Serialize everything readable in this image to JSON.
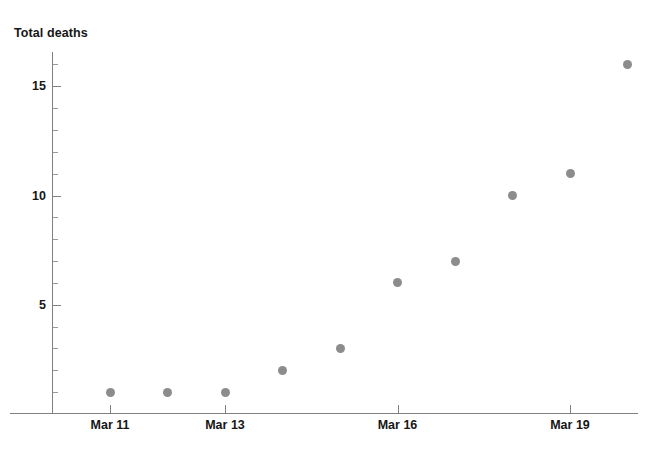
{
  "chart_data": {
    "type": "scatter",
    "title": "",
    "subtitle": "",
    "xlabel": "",
    "ylabel": "Total deaths",
    "grid": false,
    "legend": null,
    "marker_color": "#8c8c8c",
    "axis_color": "#808080",
    "text_color": "#161616",
    "x": [
      "Mar 11",
      "Mar 12",
      "Mar 13",
      "Mar 14",
      "Mar 15",
      "Mar 16",
      "Mar 17",
      "Mar 18",
      "Mar 19",
      "Mar 20"
    ],
    "values": [
      1,
      1,
      1,
      2,
      3,
      6,
      7,
      10,
      11,
      16
    ],
    "points": [
      {
        "x": "Mar 11",
        "y": 1
      },
      {
        "x": "Mar 12",
        "y": 1
      },
      {
        "x": "Mar 13",
        "y": 1
      },
      {
        "x": "Mar 14",
        "y": 2
      },
      {
        "x": "Mar 15",
        "y": 3
      },
      {
        "x": "Mar 16",
        "y": 6
      },
      {
        "x": "Mar 17",
        "y": 7
      },
      {
        "x": "Mar 18",
        "y": 10
      },
      {
        "x": "Mar 19",
        "y": 11
      },
      {
        "x": "Mar 20",
        "y": 16
      }
    ],
    "xlim": [
      "Mar 10",
      "Mar 21"
    ],
    "ylim": [
      0,
      16.7
    ],
    "x_tick_labels": [
      "Mar 11",
      "Mar 13",
      "Mar 16",
      "Mar 19"
    ],
    "y_tick_labels": [
      "5",
      "10",
      "15"
    ],
    "y_minor_tick_values": [
      1,
      2,
      3,
      4,
      6,
      7,
      8,
      9,
      11,
      12,
      13,
      14,
      16
    ],
    "y_major_tick_values": [
      5,
      10,
      15
    ],
    "annotations": []
  }
}
